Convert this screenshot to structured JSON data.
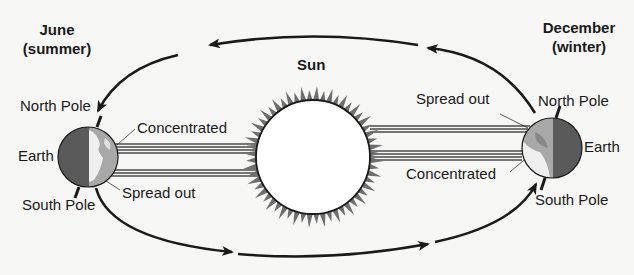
{
  "sun": {
    "label": "Sun",
    "fill": "#ffffff",
    "corona_color": "#6e6e6e"
  },
  "june": {
    "heading": "June",
    "season": "(summer)",
    "north_pole": "North Pole",
    "earth": "Earth",
    "south_pole": "South Pole",
    "concentrated": "Concentrated",
    "spread_out": "Spread out"
  },
  "december": {
    "heading": "December",
    "season": "(winter)",
    "north_pole": "North Pole",
    "earth": "Earth",
    "south_pole": "South Pole",
    "concentrated": "Concentrated",
    "spread_out": "Spread out"
  },
  "orbit": {
    "direction": "counterclockwise",
    "stroke": "#1a1a1a"
  },
  "colors": {
    "earth_dark": "#5a5a5a",
    "earth_light": "#a8a8a8",
    "ray": "#4a4a4a",
    "background": "#f7f7f5"
  }
}
